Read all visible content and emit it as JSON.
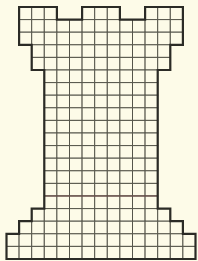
{
  "figure": {
    "background": "#fdfbe8",
    "grid_color": "#55554a",
    "outline_color": "#2b2b26",
    "accent_line_color": "#6e4a48",
    "cell_size": 12.6,
    "origin_x": 6.5,
    "origin_y": 7,
    "total_columns": 15,
    "total_rows": 20,
    "rows": [
      {
        "row": 0,
        "spans": [
          [
            1,
            3
          ],
          [
            6,
            8
          ],
          [
            11,
            13
          ]
        ]
      },
      {
        "row": 1,
        "spans": [
          [
            1,
            13
          ]
        ]
      },
      {
        "row": 2,
        "spans": [
          [
            1,
            13
          ]
        ]
      },
      {
        "row": 3,
        "spans": [
          [
            2,
            12
          ]
        ]
      },
      {
        "row": 4,
        "spans": [
          [
            2,
            12
          ]
        ]
      },
      {
        "row": 5,
        "spans": [
          [
            3,
            11
          ]
        ]
      },
      {
        "row": 6,
        "spans": [
          [
            3,
            11
          ]
        ]
      },
      {
        "row": 7,
        "spans": [
          [
            3,
            11
          ]
        ]
      },
      {
        "row": 8,
        "spans": [
          [
            3,
            11
          ]
        ]
      },
      {
        "row": 9,
        "spans": [
          [
            3,
            11
          ]
        ]
      },
      {
        "row": 10,
        "spans": [
          [
            3,
            11
          ]
        ]
      },
      {
        "row": 11,
        "spans": [
          [
            3,
            11
          ]
        ]
      },
      {
        "row": 12,
        "spans": [
          [
            3,
            11
          ]
        ]
      },
      {
        "row": 13,
        "spans": [
          [
            3,
            11
          ]
        ]
      },
      {
        "row": 14,
        "spans": [
          [
            3,
            11
          ]
        ]
      },
      {
        "row": 15,
        "spans": [
          [
            3,
            11
          ]
        ]
      },
      {
        "row": 16,
        "spans": [
          [
            2,
            12
          ]
        ]
      },
      {
        "row": 17,
        "spans": [
          [
            1,
            13
          ]
        ]
      },
      {
        "row": 18,
        "spans": [
          [
            0,
            14
          ]
        ]
      },
      {
        "row": 19,
        "spans": [
          [
            0,
            14
          ]
        ]
      }
    ],
    "accent_line_row_boundary": 15
  }
}
